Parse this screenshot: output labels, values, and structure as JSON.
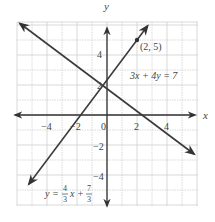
{
  "chart_data": {
    "type": "line",
    "title": "",
    "xlabel": "x",
    "ylabel": "y",
    "xlim": [
      -6,
      6
    ],
    "ylim": [
      -6,
      6
    ],
    "grid": true,
    "x_ticks": [
      -4,
      -2,
      0,
      2,
      4
    ],
    "y_ticks": [
      4,
      2,
      -2,
      -4
    ],
    "x_tick_labels": [
      "−4",
      "−2",
      "0",
      "2",
      "4"
    ],
    "y_tick_labels": [
      "4",
      "2",
      "−2",
      "−4"
    ],
    "series": [
      {
        "name": "3x + 4y = 7",
        "equation": "y = -0.75x + 1.75",
        "slope": -0.75,
        "intercept": 1.75,
        "x_range": [
          -5.8,
          5.8
        ],
        "label": "3x + 4y = 7"
      },
      {
        "name": "y = 4/3 x + 7/3",
        "equation": "y = (4/3)x + 7/3",
        "slope": 1.3333333,
        "intercept": 2.3333333,
        "x_range": [
          -5.2,
          2.7
        ],
        "label_parts": {
          "lhs": "y = ",
          "frac1_num": "4",
          "frac1_den": "3",
          "mid": "x + ",
          "frac2_num": "7",
          "frac2_den": "3"
        }
      }
    ],
    "points": [
      {
        "x": 2,
        "y": 5,
        "label": "(2, 5)"
      }
    ]
  }
}
